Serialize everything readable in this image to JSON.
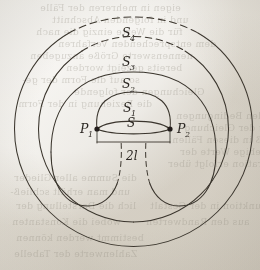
{
  "figure": {
    "kind": "geometric-diagram",
    "background_color": "#e9e6df",
    "ink_color": "#3a352d",
    "focus_marker_color": "#241f1a"
  },
  "labels": {
    "curve_outer_4": "S",
    "curve_outer_4_sub": "4",
    "curve_3": "S",
    "curve_3_sub": "3",
    "curve_2": "S",
    "curve_2_sub": "2",
    "curve_1": "S",
    "curve_1_sub": "1",
    "curve_0": "S",
    "focus_left": "P",
    "focus_left_sub": "1",
    "focus_right": "P",
    "focus_right_sub": "2",
    "separation": "2l"
  },
  "geometry": {
    "focus_left_x": 97,
    "focus_left_y": 129,
    "focus_right_x": 170,
    "focus_right_y": 129,
    "separation_label_x": 132,
    "separation_label_y": 157,
    "center_x": 133.5,
    "center_y": 129
  },
  "ghost_text": {
    "note": "faint mirrored show-through text from reverse of page",
    "lines": [
      "eigen in mehreren der Fälle",
      "und in folgenden Abschnitt",
      "für die Werte einzig die nach",
      "dem entsprechenden Verfahren",
      "nennenswerte Größe anzugeben",
      "bereits gezeigt worden",
      "so auf die Form der ge-",
      "Gleichungen der folgende",
      "die Beziehung in der Form",
      "mit den Bedingungen",
      "Lösung der Gleichung",
      "so daß in diesen Fällen",
      "für beliebige Werte der",
      "Integration erfolgt über",
      "die Summe aller Glieder",
      "und man erhält schließ-",
      "lich die Darstellung der",
      "Funktion in der Gestalt",
      "wobei die Konstanten",
      "aus den Randwerten",
      "bestimmt werden können",
      "Zahlenwerte der Tabelle"
    ]
  }
}
